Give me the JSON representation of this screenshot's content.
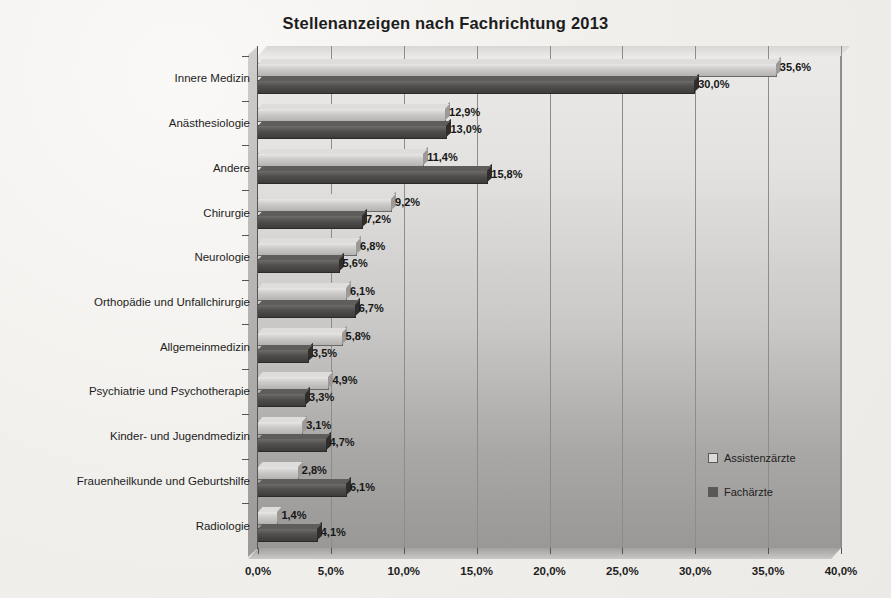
{
  "chart_data": {
    "type": "bar",
    "orientation": "horizontal",
    "title": "Stellenanzeigen nach Fachrichtung 2013",
    "xlabel": "",
    "ylabel": "",
    "xlim": [
      0,
      40
    ],
    "xtick_labels": [
      "0,0%",
      "5,0%",
      "10,0%",
      "15,0%",
      "20,0%",
      "25,0%",
      "30,0%",
      "35,0%",
      "40,0%"
    ],
    "xticks": [
      0,
      5,
      10,
      15,
      20,
      25,
      30,
      35,
      40
    ],
    "grid": "vertical",
    "legend_position": "inside-bottom-right",
    "categories": [
      "Innere Medizin",
      "Anästhesiologie",
      "Andere",
      "Chirurgie",
      "Neurologie",
      "Orthopädie und Unfallchirurgie",
      "Allgemeinmedizin",
      "Psychiatrie und Psychotherapie",
      "Kinder- und Jugendmedizin",
      "Frauenheilkunde und Geburtshilfe",
      "Radiologie"
    ],
    "series": [
      {
        "name": "Assistenzärzte",
        "color": "#cdccca",
        "values": [
          35.6,
          12.9,
          11.4,
          9.2,
          6.8,
          6.1,
          5.8,
          4.9,
          3.1,
          2.8,
          1.4
        ],
        "labels": [
          "35,6%",
          "12,9%",
          "11,4%",
          "9,2%",
          "6,8%",
          "6,1%",
          "5,8%",
          "4,9%",
          "3,1%",
          "2,8%",
          "1,4%"
        ]
      },
      {
        "name": "Fachärzte",
        "color": "#4f4e4c",
        "values": [
          30.0,
          13.0,
          15.8,
          7.2,
          5.6,
          6.7,
          3.5,
          3.3,
          4.7,
          6.1,
          4.1
        ],
        "labels": [
          "30,0%",
          "13,0%",
          "15,8%",
          "7,2%",
          "5,6%",
          "6,7%",
          "3,5%",
          "3,3%",
          "4,7%",
          "6,1%",
          "4,1%"
        ]
      }
    ]
  },
  "legend": {
    "items": [
      {
        "label": "Assistenzärzte",
        "swatch": "light"
      },
      {
        "label": "Fachärzte",
        "swatch": "dark"
      }
    ]
  }
}
